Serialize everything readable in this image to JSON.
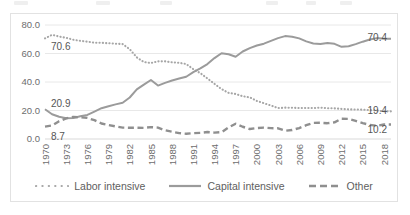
{
  "chart_data": {
    "type": "line",
    "title": "",
    "xlabel": "",
    "ylabel": "",
    "ylim": [
      0,
      80
    ],
    "ytick_labels": [
      "0.0",
      "20.0",
      "40.0",
      "60.0",
      "80.0"
    ],
    "ytick_values": [
      0,
      20,
      40,
      60,
      80
    ],
    "grid": true,
    "legend_position": "bottom",
    "x": [
      1970,
      1971,
      1972,
      1973,
      1974,
      1975,
      1976,
      1977,
      1978,
      1979,
      1980,
      1981,
      1982,
      1983,
      1984,
      1985,
      1986,
      1987,
      1988,
      1989,
      1990,
      1991,
      1992,
      1993,
      1994,
      1995,
      1996,
      1997,
      1998,
      1999,
      2000,
      2001,
      2002,
      2003,
      2004,
      2005,
      2006,
      2007,
      2008,
      2009,
      2010,
      2011,
      2012,
      2013,
      2014,
      2015,
      2016,
      2017,
      2018,
      2019
    ],
    "xtick_labels": [
      "1970",
      "1973",
      "1976",
      "1979",
      "1982",
      "1985",
      "1988",
      "1991",
      "1994",
      "1997",
      "2000",
      "2003",
      "2006",
      "2009",
      "2012",
      "2015",
      "2018"
    ],
    "series": [
      {
        "name": "Labor intensive",
        "style": "dotted",
        "color": "#a6a6a6",
        "values": [
          70.6,
          73.1,
          71.9,
          71.0,
          69.7,
          68.9,
          68.3,
          67.6,
          67.5,
          67.2,
          66.9,
          66.6,
          63.0,
          57.3,
          54.0,
          53.3,
          54.5,
          54.5,
          53.8,
          53.5,
          52.6,
          49.0,
          46.2,
          42.5,
          38.7,
          35.0,
          32.4,
          31.6,
          30.0,
          29.2,
          26.7,
          25.1,
          23.5,
          21.7,
          22.0,
          21.9,
          21.7,
          21.8,
          21.7,
          22.0,
          21.6,
          21.5,
          21.1,
          20.8,
          20.7,
          20.6,
          20.3,
          19.9,
          19.4,
          19.4
        ],
        "label_start": "70.6",
        "label_end": "19.4"
      },
      {
        "name": "Capital intensive",
        "style": "solid",
        "color": "#9b9b9b",
        "values": [
          20.9,
          17.4,
          15.6,
          14.5,
          14.8,
          15.9,
          16.9,
          19.2,
          21.6,
          23.0,
          24.3,
          25.4,
          29.1,
          34.8,
          38.2,
          41.4,
          37.5,
          39.4,
          41.1,
          42.4,
          43.7,
          46.9,
          49.5,
          52.6,
          56.8,
          60.2,
          59.5,
          57.7,
          61.4,
          63.8,
          65.6,
          66.9,
          68.9,
          70.8,
          72.2,
          71.8,
          70.6,
          68.5,
          67.0,
          66.6,
          67.3,
          66.8,
          64.7,
          65.1,
          66.6,
          68.3,
          69.8,
          70.8,
          70.4,
          70.4
        ],
        "label_start": "20.9",
        "label_end": "70.4"
      },
      {
        "name": "Other",
        "style": "dashed",
        "color": "#8f8f8f",
        "values": [
          8.7,
          9.5,
          12.5,
          14.5,
          15.5,
          15.2,
          14.8,
          13.2,
          10.9,
          9.8,
          8.8,
          8.0,
          7.9,
          7.9,
          7.8,
          8.3,
          8.0,
          6.1,
          5.1,
          4.1,
          3.7,
          4.1,
          4.3,
          4.9,
          4.5,
          4.8,
          8.1,
          10.7,
          8.6,
          7.0,
          7.7,
          8.0,
          7.6,
          7.5,
          5.8,
          6.3,
          7.7,
          9.7,
          11.3,
          11.4,
          11.1,
          11.7,
          14.2,
          14.1,
          12.7,
          11.1,
          9.9,
          9.3,
          10.2,
          10.2
        ],
        "label_start": "8.7",
        "label_end": "10.2"
      }
    ],
    "annotations": [
      {
        "text": "70.6",
        "series": "Labor intensive",
        "position": "start"
      },
      {
        "text": "19.4",
        "series": "Labor intensive",
        "position": "end"
      },
      {
        "text": "20.9",
        "series": "Capital intensive",
        "position": "start"
      },
      {
        "text": "70.4",
        "series": "Capital intensive",
        "position": "end"
      },
      {
        "text": "8.7",
        "series": "Other",
        "position": "start"
      },
      {
        "text": "10.2",
        "series": "Other",
        "position": "end"
      }
    ]
  },
  "legend": {
    "items": [
      {
        "label": "Labor intensive",
        "icon": "dotted-line-swatch"
      },
      {
        "label": "Capital intensive",
        "icon": "solid-line-swatch"
      },
      {
        "label": "Other",
        "icon": "dashed-line-swatch"
      }
    ]
  }
}
